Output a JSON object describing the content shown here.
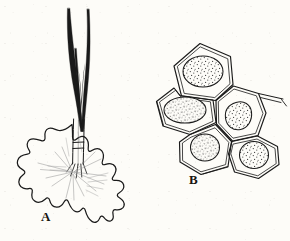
{
  "figure": {
    "background_color": "#fdfcf8",
    "ink_color": "#1a1a1a",
    "faint_ink_color": "#8c8c8c",
    "type": "scientific-line-illustration",
    "panels": [
      {
        "id": "A",
        "label": "A",
        "label_x": 42,
        "label_y": 212,
        "description": "stellate peltate trichome with long bristle hairs and lobed basal scale"
      },
      {
        "id": "B",
        "label": "B",
        "label_x": 190,
        "label_y": 175,
        "description": "cluster of five polygonal epidermal cells each with a stippled nucleus"
      }
    ],
    "panel_a": {
      "hairs": [
        {
          "name": "bristle-hair-left",
          "tip_x": 68,
          "tip_y": 8,
          "base_x": 81,
          "base_y": 133
        },
        {
          "name": "bristle-hair-right",
          "tip_x": 86,
          "tip_y": 9,
          "base_x": 84,
          "base_y": 133
        },
        {
          "name": "bristle-hair-inner",
          "tip_x": 75,
          "tip_y": 48,
          "base_x": 82,
          "base_y": 133
        }
      ],
      "stalk": {
        "top_y": 120,
        "bottom_y": 172,
        "node_y": 146,
        "x": 76
      },
      "scale": {
        "name": "lobed-basal-scale",
        "center_x": 70,
        "center_y": 166,
        "lobe_count": 10,
        "left_extent": 17,
        "right_extent": 123,
        "top_extent": 124,
        "bottom_extent": 228
      },
      "radiating_lines": 11
    },
    "panel_b": {
      "cell_count": 5,
      "cells": [
        {
          "name": "cell-top",
          "cx": 203,
          "cy": 72,
          "nucleus_rx": 20,
          "nucleus_ry": 15,
          "sides": 6
        },
        {
          "name": "cell-left",
          "cx": 185,
          "cy": 110,
          "nucleus_rx": 21,
          "nucleus_ry": 13,
          "sides": 6
        },
        {
          "name": "cell-middle-right",
          "cx": 235,
          "cy": 117,
          "nucleus_rx": 15,
          "nucleus_ry": 15,
          "sides": 7
        },
        {
          "name": "cell-bottom-left",
          "cx": 205,
          "cy": 148,
          "nucleus_rx": 14,
          "nucleus_ry": 13,
          "sides": 6
        },
        {
          "name": "cell-bottom-right",
          "cx": 254,
          "cy": 155,
          "nucleus_rx": 14,
          "nucleus_ry": 13,
          "sides": 6
        }
      ],
      "cluster_bounds": {
        "left": 156,
        "top": 42,
        "right": 287,
        "bottom": 180
      }
    }
  }
}
